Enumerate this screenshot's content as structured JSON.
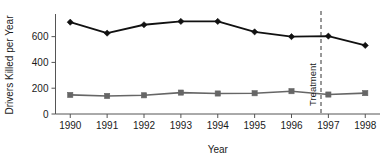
{
  "chart_data": {
    "type": "line",
    "title": "",
    "subtitle": "",
    "xlabel": "Year",
    "ylabel": "Drivers Killed per Year",
    "x": [
      1990,
      1991,
      1992,
      1993,
      1994,
      1995,
      1996,
      1997,
      1998
    ],
    "categories": [
      "1990",
      "1991",
      "1992",
      "1993",
      "1994",
      "1995",
      "1996",
      "1997",
      "1998"
    ],
    "xtick_labels": [
      "1990",
      "1991",
      "1992",
      "1993",
      "1994",
      "1995",
      "1996",
      "1997",
      "1998"
    ],
    "ytick_labels": [
      "0",
      "200",
      "400",
      "600"
    ],
    "yticks": [
      0,
      200,
      400,
      600
    ],
    "ylim": [
      0,
      760
    ],
    "xlim": [
      1989.6,
      1998.4
    ],
    "grid": false,
    "legend": "none",
    "series": [
      {
        "name": "upper-series",
        "marker": "diamond",
        "color": "#111111",
        "values": [
          712,
          627,
          692,
          718,
          718,
          637,
          600,
          604,
          532
        ]
      },
      {
        "name": "lower-series",
        "marker": "square",
        "color": "#666666",
        "values": [
          148,
          140,
          145,
          166,
          159,
          161,
          177,
          151,
          162
        ]
      }
    ],
    "annotations": [
      {
        "name": "treatment-line",
        "label": "Treatment",
        "x": 1996.8,
        "style": "dashed-vertical",
        "color": "#333333",
        "label_rotation": -90
      }
    ]
  },
  "axis": {
    "y_title": "Drivers Killed per Year",
    "x_title": "Year"
  },
  "colors": {
    "upper": "#111111",
    "lower": "#666666",
    "axis": "#555555",
    "annotation": "#333333",
    "background": "#ffffff"
  }
}
